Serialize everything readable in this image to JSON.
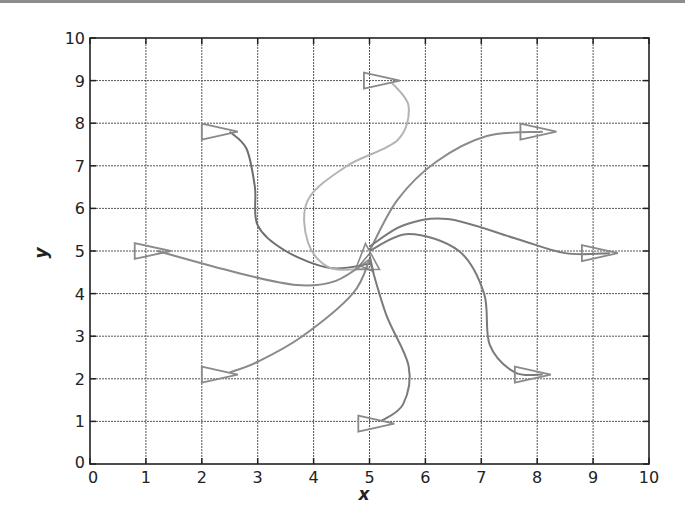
{
  "chart_data": {
    "type": "line",
    "title": "",
    "xlabel": "x",
    "ylabel": "y",
    "xlim": [
      0,
      10
    ],
    "ylim": [
      0,
      10
    ],
    "grid": true,
    "x_ticks": [
      "0",
      "1",
      "2",
      "3",
      "4",
      "5",
      "6",
      "7",
      "8",
      "9",
      "10"
    ],
    "y_ticks": [
      "0",
      "1",
      "2",
      "3",
      "4",
      "5",
      "6",
      "7",
      "8",
      "9",
      "10"
    ],
    "center": [
      5,
      4.8
    ],
    "series": [
      {
        "name": "path-to-upper-left",
        "color": "#6e6e6e",
        "points": [
          [
            5,
            4.7
          ],
          [
            4.3,
            4.6
          ],
          [
            3.5,
            5.0
          ],
          [
            3.0,
            5.6
          ],
          [
            2.95,
            6.5
          ],
          [
            2.8,
            7.4
          ],
          [
            2.5,
            7.8
          ]
        ],
        "end_marker": [
          2.0,
          7.8
        ]
      },
      {
        "name": "path-to-top",
        "color": "#b4b4b4",
        "points": [
          [
            5,
            4.6
          ],
          [
            4.3,
            4.6
          ],
          [
            3.9,
            5.2
          ],
          [
            3.9,
            6.2
          ],
          [
            4.6,
            7.0
          ],
          [
            5.5,
            7.6
          ],
          [
            5.7,
            8.4
          ],
          [
            5.4,
            8.95
          ]
        ],
        "end_marker": [
          4.9,
          9.0
        ]
      },
      {
        "name": "path-to-upper-right",
        "color": "#8a8a8a",
        "points": [
          [
            5,
            5.0
          ],
          [
            5.5,
            6.2
          ],
          [
            6.2,
            7.1
          ],
          [
            7.1,
            7.7
          ],
          [
            8.1,
            7.8
          ]
        ],
        "end_marker": [
          7.7,
          7.8
        ]
      },
      {
        "name": "path-to-left",
        "color": "#8a8a8a",
        "points": [
          [
            5,
            4.8
          ],
          [
            4.4,
            4.3
          ],
          [
            3.7,
            4.2
          ],
          [
            2.6,
            4.5
          ],
          [
            1.2,
            5.0
          ]
        ],
        "end_marker": [
          0.8,
          5.0
        ]
      },
      {
        "name": "path-to-right",
        "color": "#7a7a7a",
        "points": [
          [
            5,
            5.1
          ],
          [
            5.6,
            5.6
          ],
          [
            6.4,
            5.75
          ],
          [
            7.6,
            5.3
          ],
          [
            8.5,
            4.95
          ],
          [
            9.3,
            4.95
          ]
        ],
        "end_marker": [
          8.8,
          4.95
        ]
      },
      {
        "name": "path-to-lower-right",
        "color": "#7a7a7a",
        "points": [
          [
            5,
            5.0
          ],
          [
            5.7,
            5.4
          ],
          [
            6.6,
            5.0
          ],
          [
            7.05,
            4.0
          ],
          [
            7.15,
            2.8
          ],
          [
            7.6,
            2.15
          ],
          [
            8.1,
            2.1
          ]
        ],
        "end_marker": [
          7.6,
          2.1
        ]
      },
      {
        "name": "path-to-lower-left",
        "color": "#8a8a8a",
        "points": [
          [
            5,
            4.8
          ],
          [
            4.7,
            4.0
          ],
          [
            3.8,
            3.0
          ],
          [
            3.0,
            2.4
          ],
          [
            2.5,
            2.15
          ]
        ],
        "end_marker": [
          2.0,
          2.1
        ]
      },
      {
        "name": "path-to-bottom",
        "color": "#7a7a7a",
        "points": [
          [
            5,
            4.8
          ],
          [
            5.3,
            3.5
          ],
          [
            5.7,
            2.3
          ],
          [
            5.6,
            1.4
          ],
          [
            5.2,
            1.0
          ]
        ],
        "end_marker": [
          4.8,
          0.95
        ]
      }
    ]
  }
}
